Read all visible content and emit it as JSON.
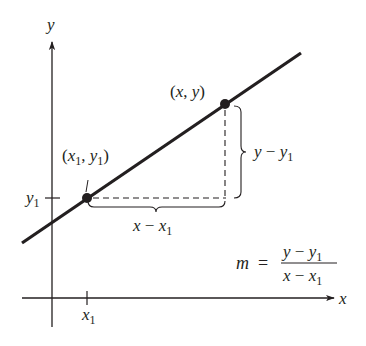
{
  "figure": {
    "type": "point-slope diagram",
    "axes": {
      "x_label": "x",
      "y_label": "y"
    },
    "points": [
      {
        "id": "p1",
        "label": "(x₁, y₁)",
        "label_parts": {
          "open": "(",
          "x": "x",
          "x_sub": "1",
          "sep": ", ",
          "y": "y",
          "y_sub": "1",
          "close": ")"
        }
      },
      {
        "id": "p2",
        "label": "(x, y)",
        "label_parts": {
          "open": "(",
          "x": "x",
          "sep": ", ",
          "y": "y",
          "close": ")"
        }
      }
    ],
    "ticks": {
      "x_tick": {
        "base": "x",
        "sub": "1"
      },
      "y_tick": {
        "base": "y",
        "sub": "1"
      }
    },
    "braces": {
      "rise": {
        "base1": "y",
        "minus": " − ",
        "base2": "y",
        "sub": "1"
      },
      "run": {
        "base1": "x",
        "minus": " − ",
        "base2": "x",
        "sub": "1"
      }
    },
    "formula": {
      "lhs": "m",
      "eq": "=",
      "numerator": {
        "base1": "y",
        "minus": " − ",
        "base2": "y",
        "sub": "1"
      },
      "denominator": {
        "base1": "x",
        "minus": " − ",
        "base2": "x",
        "sub": "1"
      }
    },
    "colors": {
      "ink": "#231f20",
      "background": "#ffffff"
    }
  }
}
